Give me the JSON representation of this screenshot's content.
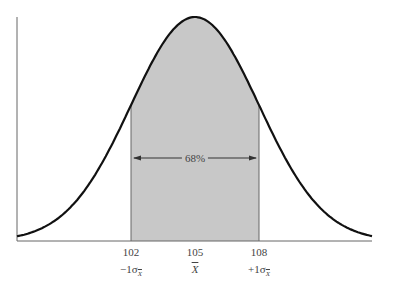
{
  "chart_data": {
    "type": "area",
    "title": "",
    "xlabel": "",
    "ylabel": "",
    "mean": 105,
    "std_error": 3,
    "x_ticks": [
      102,
      105,
      108
    ],
    "x_tick_labels": [
      "102",
      "105",
      "108"
    ],
    "sigma_labels": [
      "-1σX̄",
      "X̄",
      "+1σX̄"
    ],
    "shaded_range": [
      102,
      108
    ],
    "shaded_percent_label": "68%",
    "xlim": [
      94,
      116
    ],
    "grid": false,
    "legend": null
  },
  "colors": {
    "curve": "#111111",
    "shade": "#c8c8c8",
    "axis": "#555555",
    "text": "#444444"
  },
  "labels": {
    "pct": "68%",
    "tick_102": "102",
    "tick_105": "105",
    "tick_108": "108",
    "sigma_minus_prefix": "−1σ",
    "sigma_sub": "X",
    "xbar": "X",
    "sigma_plus_prefix": "+1σ"
  }
}
